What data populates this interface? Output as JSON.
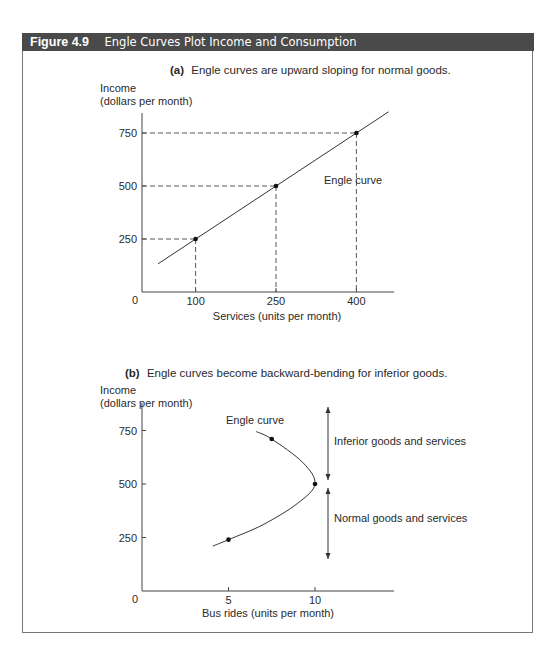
{
  "figure": {
    "number": "Figure 4.9",
    "title": "Engle Curves Plot Income and Consumption",
    "header_color": "#4a4a4a"
  },
  "chart_data": [
    {
      "id": "a",
      "type": "line",
      "panel_label": "(a)",
      "title": "Engle curves are upward sloping for normal goods.",
      "ylabel_line1": "Income",
      "ylabel_line2": "(dollars per month)",
      "xlabel": "Services (units per month)",
      "origin_label": "0",
      "x_ticks": [
        100,
        250,
        400
      ],
      "y_ticks": [
        250,
        500,
        750
      ],
      "xlim": [
        0,
        480
      ],
      "ylim": [
        0,
        860
      ],
      "grid": false,
      "series": [
        {
          "name": "Engle curve",
          "points": [
            {
              "x": 100,
              "y": 250
            },
            {
              "x": 250,
              "y": 500
            },
            {
              "x": 400,
              "y": 750
            }
          ],
          "line_extent": [
            {
              "x": 30,
              "y": 133
            },
            {
              "x": 460,
              "y": 850
            }
          ]
        }
      ],
      "dashed_guides": true,
      "annotations": [
        {
          "text": "Engle curve",
          "x": 400,
          "y": 540
        }
      ]
    },
    {
      "id": "b",
      "type": "line",
      "panel_label": "(b)",
      "title": "Engle curves become backward-bending for inferior goods.",
      "ylabel_line1": "Income",
      "ylabel_line2": "(dollars per month)",
      "xlabel": "Bus rides (units per month)",
      "origin_label": "0",
      "x_ticks": [
        5,
        10
      ],
      "y_ticks": [
        250,
        500,
        750
      ],
      "xlim": [
        0,
        14.5
      ],
      "ylim": [
        0,
        880
      ],
      "grid": false,
      "series": [
        {
          "name": "Engle curve",
          "points": [
            {
              "x": 5,
              "y": 240
            },
            {
              "x": 10,
              "y": 500
            },
            {
              "x": 7.5,
              "y": 710
            }
          ],
          "curve": [
            {
              "x": 4.1,
              "y": 210
            },
            {
              "x": 5,
              "y": 240
            },
            {
              "x": 7,
              "y": 310
            },
            {
              "x": 9,
              "y": 410
            },
            {
              "x": 10,
              "y": 500
            },
            {
              "x": 9.3,
              "y": 600
            },
            {
              "x": 7.5,
              "y": 710
            },
            {
              "x": 6.6,
              "y": 745
            }
          ]
        }
      ],
      "annotations": [
        {
          "text": "Engle curve",
          "x": 4.8,
          "y": 800
        },
        {
          "text": "Inferior goods and services",
          "x": 11.2,
          "y": 700,
          "range": [
            500,
            860
          ]
        },
        {
          "text": "Normal goods and services",
          "x": 11.2,
          "y": 340,
          "range": [
            150,
            500
          ]
        }
      ]
    }
  ]
}
